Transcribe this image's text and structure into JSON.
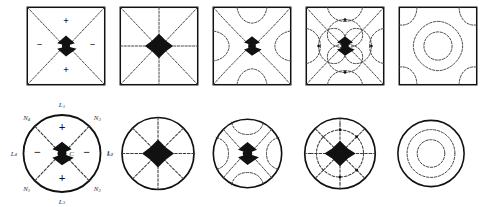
{
  "figure": {
    "rows": [
      {
        "name": "square-domain-row",
        "shape": "square"
      },
      {
        "name": "circular-domain-row",
        "shape": "circle"
      }
    ]
  },
  "signs": {
    "plus": "+",
    "minus": "−"
  },
  "square_panels": [
    {
      "id": "sq-1",
      "caption": "",
      "pattern": "two-crossing-diagonals",
      "signs": [
        {
          "label": "+",
          "x": 50,
          "y": 22
        },
        {
          "label": "+",
          "x": 50,
          "y": 78
        },
        {
          "label": "−",
          "x": 20,
          "y": 50
        },
        {
          "label": "−",
          "x": 80,
          "y": 50
        }
      ]
    },
    {
      "id": "sq-2",
      "caption": "",
      "pattern": "four-lines-eight-sectors",
      "signs": []
    },
    {
      "id": "sq-3",
      "caption": "",
      "pattern": "diagonals-with-edge-arcs",
      "signs": []
    },
    {
      "id": "sq-4",
      "caption": "",
      "pattern": "diagonals-with-nested-lobes",
      "signs": []
    },
    {
      "id": "sq-5",
      "caption": "",
      "pattern": "concentric-closed-contours",
      "signs": []
    }
  ],
  "circle_panels": [
    {
      "id": "ci-1",
      "pattern": "two-crossing-diameters",
      "center_label": "C",
      "signs": [
        {
          "label": "+",
          "x": 50,
          "y": 24
        },
        {
          "label": "+",
          "x": 50,
          "y": 76
        },
        {
          "label": "−",
          "x": 22,
          "y": 50
        },
        {
          "label": "−",
          "x": 78,
          "y": 50
        }
      ],
      "boundary_labels": [
        {
          "base": "L",
          "sub": "1",
          "x": 50,
          "y": 4
        },
        {
          "base": "L",
          "sub": "3",
          "x": 50,
          "y": 96
        },
        {
          "base": "L",
          "sub": "4",
          "x": 4,
          "y": 50
        },
        {
          "base": "L",
          "sub": "2",
          "x": 96,
          "y": 50
        },
        {
          "base": "N",
          "sub": "4",
          "x": 16,
          "y": 16
        },
        {
          "base": "N",
          "sub": "3",
          "x": 84,
          "y": 16
        },
        {
          "base": "N",
          "sub": "1",
          "x": 16,
          "y": 84
        },
        {
          "base": "N",
          "sub": "2",
          "x": 84,
          "y": 84
        }
      ]
    },
    {
      "id": "ci-2",
      "pattern": "eight-radial-spokes",
      "center_label": "",
      "signs": [],
      "boundary_labels": [
        {
          "base": "L",
          "sub": "1",
          "x": 3,
          "y": 50
        }
      ]
    },
    {
      "id": "ci-3",
      "pattern": "diagonals-with-boundary-arcs",
      "center_label": "",
      "signs": [],
      "boundary_labels": []
    },
    {
      "id": "ci-4",
      "pattern": "spokes-with-inner-circle",
      "center_label": "",
      "signs": [],
      "boundary_labels": []
    },
    {
      "id": "ci-5",
      "pattern": "three-concentric-circles",
      "center_label": "",
      "signs": [],
      "boundary_labels": []
    }
  ],
  "colors": {
    "ink": "#111111",
    "nodal": "#3a3a3a",
    "background": "#ffffff"
  }
}
